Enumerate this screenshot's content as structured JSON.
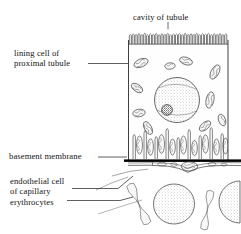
{
  "figure": {
    "type": "biological-schematic-diagram",
    "background_color": "#ffffff",
    "ink_color": "#1a1a1a"
  },
  "labels": {
    "cavity": "cavity of tubule",
    "lining_line1": "lining cell of",
    "lining_line2": "proximal tubule",
    "basement": "basement membrane",
    "endothelial_line1": "endothelial cell",
    "endothelial_line2": "of capillary",
    "erythrocytes": "erythrocytes"
  },
  "structures": [
    {
      "name": "microvilli-brush-border",
      "description": "dense row of hairpin loops along apical surface",
      "count": 34
    },
    {
      "name": "tubule-cell-body",
      "description": "tall columnar epithelial cell outline"
    },
    {
      "name": "nucleus",
      "description": "large stippled round nucleus with dark nucleolus"
    },
    {
      "name": "nucleolus",
      "description": "small dark stippled body inside nucleus"
    },
    {
      "name": "mitochondria",
      "description": "elongated ovals with internal cristae",
      "count": 22
    },
    {
      "name": "basal-infoldings",
      "description": "vertical tapered columns at cell base",
      "count": 9
    },
    {
      "name": "basement-membrane",
      "description": "thick solid black horizontal bar"
    },
    {
      "name": "endothelial-cell",
      "description": "thin wavy capillary lining with vesicles and nucleus bulge"
    },
    {
      "name": "erythrocytes",
      "description": "stippled biconcave discs, edge-on and face-on",
      "count": 4
    }
  ],
  "colors": {
    "ink": "#1a1a1a",
    "membrane": "#000000",
    "stipple": "#9a9a9a",
    "leader": "#2b2b2b",
    "fill_light": "#fdfdfd"
  }
}
